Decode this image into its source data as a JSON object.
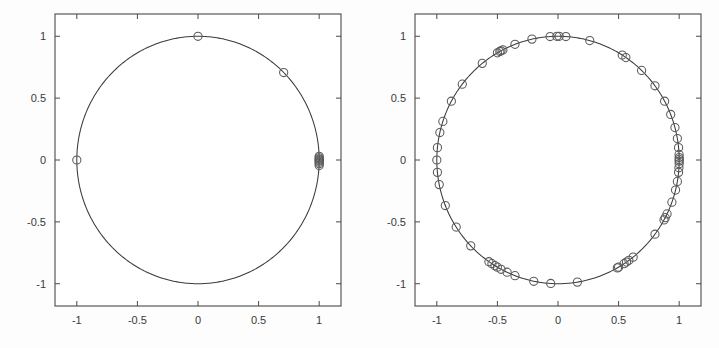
{
  "figure": {
    "background_color": "#fdfdfd",
    "axes_color": "#4a4a4a",
    "curve_color": "#3b3b3b",
    "marker_color": "#5a5a5a",
    "tick_label_color": "#3a3a3a"
  },
  "chart_data": [
    {
      "type": "scatter",
      "title": "",
      "subtitle": "",
      "xlabel": "",
      "ylabel": "",
      "xlim": [
        -1.18,
        1.18
      ],
      "ylim": [
        -1.18,
        1.18
      ],
      "xticks": [
        -1,
        -0.5,
        0,
        0.5,
        1
      ],
      "xticklabels": [
        "-1",
        "-0.5",
        "0",
        "0.5",
        "1"
      ],
      "yticks": [
        -1,
        -0.5,
        0,
        0.5,
        1
      ],
      "yticklabels": [
        "-1",
        "-0.5",
        "0",
        "0.5",
        "1"
      ],
      "grid": false,
      "legend": null,
      "annotations": [],
      "series": [
        {
          "name": "unit-circle",
          "type": "line",
          "marker": "none",
          "description": "unit circle x^2 + y^2 = 1"
        },
        {
          "name": "points",
          "type": "scatter",
          "marker": "o",
          "marker_size": 5,
          "x": [
            0.0,
            0.707,
            1.0,
            1.0,
            1.0,
            1.0,
            1.0,
            1.0,
            1.0,
            1.0,
            -1.0
          ],
          "y": [
            1.0,
            0.707,
            0.03,
            0.018,
            0.008,
            0.0,
            -0.008,
            -0.018,
            -0.03,
            -0.045,
            0.0
          ]
        }
      ]
    },
    {
      "type": "scatter",
      "title": "",
      "subtitle": "",
      "xlabel": "",
      "ylabel": "",
      "xlim": [
        -1.18,
        1.18
      ],
      "ylim": [
        -1.18,
        1.18
      ],
      "xticks": [
        -1,
        -0.5,
        0,
        0.5,
        1
      ],
      "xticklabels": [
        "-1",
        "-0.5",
        "0",
        "0.5",
        "1"
      ],
      "yticks": [
        -1,
        -0.5,
        0,
        0.5,
        1
      ],
      "yticklabels": [
        "-1",
        "-0.5",
        "0",
        "0.5",
        "1"
      ],
      "grid": false,
      "legend": null,
      "annotations": [],
      "series": [
        {
          "name": "unit-circle",
          "type": "line",
          "marker": "none",
          "description": "unit circle x^2 + y^2 = 1"
        },
        {
          "name": "points",
          "type": "scatter",
          "marker": "o",
          "marker_size": 5,
          "x": [
            0.01,
            0.065,
            0.262,
            0.53,
            0.56,
            0.69,
            0.8,
            0.88,
            0.93,
            0.965,
            0.985,
            0.995,
            0.999,
            1.0,
            1.0,
            1.0,
            1.0,
            0.998,
            0.995,
            0.985,
            0.97,
            0.94,
            0.9,
            0.885,
            0.875,
            0.8,
            0.62,
            0.585,
            0.565,
            0.545,
            0.5,
            0.49,
            0.16,
            -0.06,
            -0.2,
            -0.355,
            -0.42,
            -0.47,
            -0.5,
            -0.52,
            -0.545,
            -0.57,
            -0.72,
            -0.84,
            -0.93,
            -0.98,
            -0.995,
            -1.0,
            -0.995,
            -0.975,
            -0.95,
            -0.88,
            -0.79,
            -0.625,
            -0.5,
            -0.48,
            -0.47,
            -0.455,
            -0.355,
            -0.215,
            -0.065,
            -0.01
          ],
          "y": [
            1.0,
            0.998,
            0.965,
            0.848,
            0.828,
            0.724,
            0.6,
            0.475,
            0.368,
            0.262,
            0.173,
            0.1,
            0.045,
            0.02,
            0.005,
            -0.01,
            -0.03,
            -0.063,
            -0.1,
            -0.173,
            -0.243,
            -0.341,
            -0.436,
            -0.466,
            -0.484,
            -0.6,
            -0.785,
            -0.811,
            -0.825,
            -0.838,
            -0.866,
            -0.872,
            -0.987,
            -0.998,
            -0.98,
            -0.935,
            -0.907,
            -0.883,
            -0.866,
            -0.854,
            -0.838,
            -0.822,
            -0.694,
            -0.542,
            -0.368,
            -0.199,
            -0.1,
            0.0,
            0.1,
            0.222,
            0.312,
            0.475,
            0.613,
            0.781,
            0.866,
            0.877,
            0.883,
            0.89,
            0.935,
            0.977,
            0.998,
            1.0
          ]
        }
      ]
    }
  ]
}
